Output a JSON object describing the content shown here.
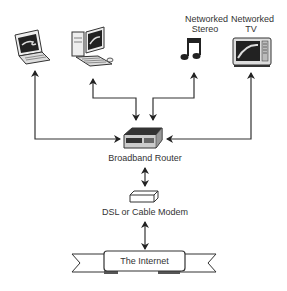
{
  "devices": {
    "laptop": {
      "label": ""
    },
    "desktop": {
      "label": ""
    },
    "stereo": {
      "label_line1": "Networked",
      "label_line2": "Stereo"
    },
    "tv": {
      "label_line1": "Networked",
      "label_line2": "TV"
    }
  },
  "router": {
    "label": "Broadband Router"
  },
  "modem": {
    "label": "DSL or Cable Modem"
  },
  "internet": {
    "label": "The Internet"
  },
  "colors": {
    "line": "#333333",
    "fill": "#ffffff",
    "dark": "#222222",
    "gray": "#888888"
  }
}
